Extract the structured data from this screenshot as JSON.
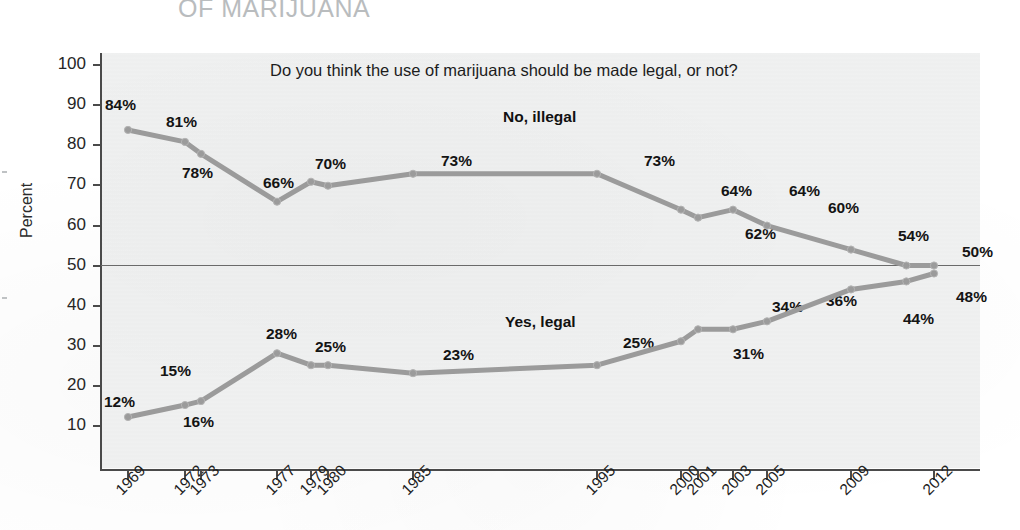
{
  "page": {
    "cut_off_title": "OF MARIJUANA"
  },
  "chart": {
    "subtitle": "Do you think the use of marijuana should be made legal, or not?",
    "y_axis_title": "Percent",
    "series_labels": {
      "illegal": "No, illegal",
      "legal": "Yes, legal"
    },
    "y_ticks": [
      "100",
      "90",
      "80",
      "70",
      "60",
      "50",
      "40",
      "30",
      "20",
      "10"
    ],
    "x_ticks": [
      "1969",
      "1972",
      "1973",
      "1977",
      "1979",
      "1980",
      "1985",
      "1995",
      "2000",
      "2001",
      "2003",
      "2005",
      "2009",
      "2012"
    ],
    "colors": {
      "line": "#9b9b9b",
      "plot_background": "#f0f1f1",
      "axis": "#4a4a4a",
      "cut_title": "#b9bcbe",
      "label_text": "#141414"
    }
  },
  "chart_data": {
    "type": "line",
    "title": "OF MARIJUANA",
    "subtitle": "Do you think the use of marijuana should be made legal, or not?",
    "xlabel": "",
    "ylabel": "Percent",
    "ylim": [
      0,
      100
    ],
    "yticks": [
      10,
      20,
      30,
      40,
      50,
      60,
      70,
      80,
      90,
      100
    ],
    "grid": false,
    "reference_line_y": 50,
    "legend_position": "inline-annotation",
    "x": [
      1969,
      1972,
      1973,
      1977,
      1979,
      1980,
      1985,
      1995,
      2000,
      2001,
      2003,
      2005,
      2009,
      2011,
      2012
    ],
    "series": [
      {
        "name": "No, illegal",
        "values": [
          84,
          81,
          78,
          66,
          71,
          70,
          73,
          73,
          64,
          62,
          64,
          60,
          54,
          50,
          50
        ],
        "labeled_points": [
          {
            "x": 1969,
            "label": "84%"
          },
          {
            "x": 1972,
            "label": "81%"
          },
          {
            "x": 1973,
            "label": "78%"
          },
          {
            "x": 1977,
            "label": "66%"
          },
          {
            "x": 1979,
            "label": "70%"
          },
          {
            "x": 1985,
            "label": "73%"
          },
          {
            "x": 1995,
            "label": "73%"
          },
          {
            "x": 2000,
            "label": "64%"
          },
          {
            "x": 2001,
            "label": "62%"
          },
          {
            "x": 2003,
            "label": "64%"
          },
          {
            "x": 2005,
            "label": "60%"
          },
          {
            "x": 2009,
            "label": "54%"
          },
          {
            "x": 2012,
            "label": "50%"
          }
        ]
      },
      {
        "name": "Yes, legal",
        "values": [
          12,
          15,
          16,
          28,
          25,
          25,
          23,
          25,
          31,
          34,
          34,
          36,
          44,
          46,
          48
        ],
        "labeled_points": [
          {
            "x": 1969,
            "label": "12%"
          },
          {
            "x": 1972,
            "label": "15%"
          },
          {
            "x": 1973,
            "label": "16%"
          },
          {
            "x": 1977,
            "label": "28%"
          },
          {
            "x": 1979,
            "label": "25%"
          },
          {
            "x": 1985,
            "label": "23%"
          },
          {
            "x": 1995,
            "label": "25%"
          },
          {
            "x": 2000,
            "label": "31%"
          },
          {
            "x": 2001,
            "label": "34%"
          },
          {
            "x": 2003,
            "label": "34%"
          },
          {
            "x": 2005,
            "label": "36%"
          },
          {
            "x": 2009,
            "label": "44%"
          },
          {
            "x": 2012,
            "label": "48%"
          }
        ]
      }
    ]
  },
  "point_labels": {
    "illegal": [
      {
        "text": "84%",
        "left": 105,
        "top": 96
      },
      {
        "text": "81%",
        "left": 166,
        "top": 113
      },
      {
        "text": "78%",
        "left": 182,
        "top": 164
      },
      {
        "text": "66%",
        "left": 263,
        "top": 174
      },
      {
        "text": "70%",
        "left": 315,
        "top": 155
      },
      {
        "text": "73%",
        "left": 441,
        "top": 152
      },
      {
        "text": "73%",
        "left": 644,
        "top": 152
      },
      {
        "text": "64%",
        "left": 721,
        "top": 182
      },
      {
        "text": "62%",
        "left": 745,
        "top": 225
      },
      {
        "text": "64%",
        "left": 789,
        "top": 182
      },
      {
        "text": "60%",
        "left": 828,
        "top": 199
      },
      {
        "text": "54%",
        "left": 898,
        "top": 227
      },
      {
        "text": "50%",
        "left": 962,
        "top": 243
      }
    ],
    "legal": [
      {
        "text": "12%",
        "left": 104,
        "top": 393
      },
      {
        "text": "15%",
        "left": 160,
        "top": 362
      },
      {
        "text": "16%",
        "left": 183,
        "top": 413
      },
      {
        "text": "28%",
        "left": 266,
        "top": 325
      },
      {
        "text": "25%",
        "left": 315,
        "top": 338
      },
      {
        "text": "23%",
        "left": 443,
        "top": 346
      },
      {
        "text": "25%",
        "left": 623,
        "top": 334
      },
      {
        "text": "31%",
        "left": 733,
        "top": 345
      },
      {
        "text": "34%",
        "left": 772,
        "top": 298
      },
      {
        "text": "36%",
        "left": 826,
        "top": 292
      },
      {
        "text": "44%",
        "left": 903,
        "top": 310
      },
      {
        "text": "48%",
        "left": 956,
        "top": 288
      }
    ]
  },
  "geometry": {
    "y_tick_tops": [
      64,
      104,
      144,
      184,
      225,
      265,
      305,
      345,
      385,
      425
    ],
    "x_tick_lefts": [
      127,
      184,
      200,
      276,
      310,
      327,
      412,
      596,
      680,
      697,
      732,
      766,
      850,
      933
    ],
    "x_label_lefts": [
      112,
      170,
      186,
      262,
      296,
      313,
      398,
      582,
      666,
      683,
      718,
      752,
      836,
      919
    ]
  }
}
